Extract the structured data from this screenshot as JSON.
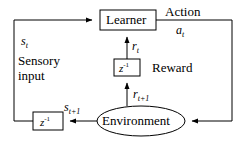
{
  "diagram": {
    "stroke_color": "#000000",
    "background_color": "#ffffff",
    "nodes": [
      {
        "id": "learner",
        "shape": "rectangle",
        "label": "Learner"
      },
      {
        "id": "delay_reward",
        "shape": "rectangle",
        "label_base": "z",
        "label_exp": "-1"
      },
      {
        "id": "delay_state",
        "shape": "rectangle",
        "label_base": "z",
        "label_exp": "-1"
      },
      {
        "id": "environment",
        "shape": "ellipse",
        "label": "Environment"
      }
    ],
    "labels": {
      "action": "Action",
      "action_sym_base": "a",
      "action_sym_sub": "t",
      "reward": "Reward",
      "reward_sym_base": "r",
      "reward_sym_sub": "t",
      "reward_next_base": "r",
      "reward_next_sub": "t+1",
      "state_sym_base": "s",
      "state_sym_sub": "t",
      "state_next_base": "s",
      "state_next_sub": "t+1",
      "sensory_line1": "Sensory",
      "sensory_line2": "input"
    }
  }
}
